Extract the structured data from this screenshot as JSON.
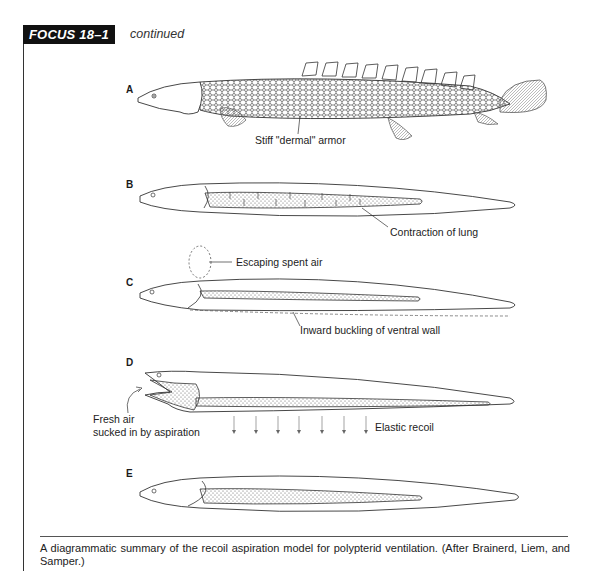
{
  "header": {
    "box_label": "FOCUS 18–1",
    "subtitle": "continued"
  },
  "figure": {
    "panels": [
      {
        "label": "A",
        "annotations": [
          "Stiff \"dermal\" armor"
        ]
      },
      {
        "label": "B",
        "annotations": [
          "Contraction of lung"
        ]
      },
      {
        "label": "C",
        "annotations": [
          "Escaping spent air",
          "Inward buckling of ventral wall"
        ]
      },
      {
        "label": "D",
        "annotations": [
          "Fresh air",
          "sucked in by aspiration",
          "Elastic recoil"
        ]
      },
      {
        "label": "E",
        "annotations": []
      }
    ]
  },
  "caption": {
    "text": "A diagrammatic summary of the recoil aspiration model for polypterid ventilation. (After Brainerd, Liem, and Samper.)"
  }
}
